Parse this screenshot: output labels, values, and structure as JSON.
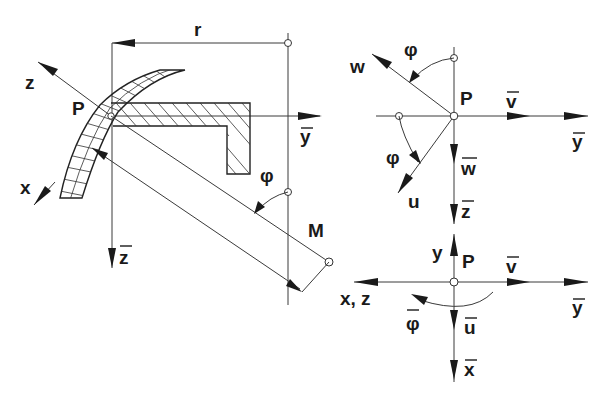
{
  "diagram": {
    "left_view": {
      "labels": {
        "r": "r",
        "z": "z",
        "P": "P",
        "x": "x",
        "y_bar": "y",
        "z_bar": "z",
        "phi": "φ",
        "M": "M"
      }
    },
    "top_right_view": {
      "labels": {
        "w": "w",
        "phi_top": "φ",
        "P": "P",
        "v_bar": "v",
        "y_bar": "y",
        "phi_bottom": "φ",
        "w_bar": "w",
        "u": "u",
        "z_bar": "z"
      }
    },
    "bottom_right_view": {
      "labels": {
        "y": "y",
        "P": "P",
        "v_bar": "v",
        "xz": "x, z",
        "y_bar": "y",
        "phi_bar": "φ",
        "u_bar": "u",
        "x_bar": "x"
      }
    }
  }
}
